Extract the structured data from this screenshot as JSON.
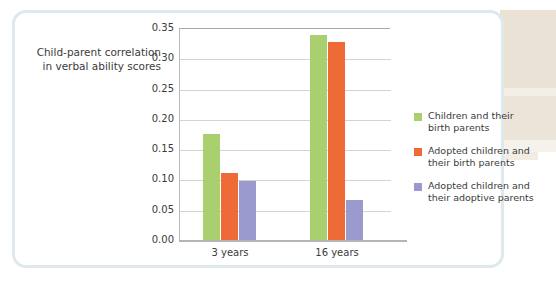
{
  "chart_data": {
    "type": "bar",
    "title": "",
    "xlabel": "",
    "ylabel": "Child-parent correlation\nin verbal ability scores",
    "ylabel_line1": "Child-parent correlation",
    "ylabel_line2": "in verbal ability scores",
    "categories": [
      "3 years",
      "16 years"
    ],
    "series": [
      {
        "name": "Children and their birth parents",
        "name_line1": "Children and their",
        "name_line2": "birth parents",
        "color": "#a9cf6e",
        "values": [
          0.175,
          0.338
        ]
      },
      {
        "name": "Adopted children and their birth parents",
        "name_line1": "Adopted children and",
        "name_line2": "their birth parents",
        "color": "#ee6b37",
        "values": [
          0.111,
          0.327
        ]
      },
      {
        "name": "Adopted children and their adoptive parents",
        "name_line1": "Adopted children and",
        "name_line2": "their adoptive parents",
        "color": "#9a9ace",
        "values": [
          0.097,
          0.066
        ]
      }
    ],
    "ylim": [
      0.0,
      0.35
    ],
    "ytick_values": [
      0.35,
      0.3,
      0.25,
      0.2,
      0.15,
      0.1,
      0.05,
      0.0
    ],
    "yticks": [
      "0.35",
      "0.30",
      "0.25",
      "0.20",
      "0.15",
      "0.10",
      "0.05",
      "0.00"
    ],
    "grid": true,
    "legend_position": "right"
  }
}
